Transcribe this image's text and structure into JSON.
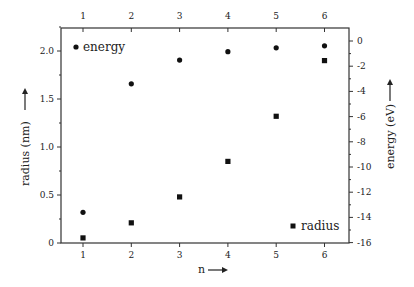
{
  "chart_data": {
    "type": "scatter",
    "title": "",
    "xlabel": "n",
    "ylabel_left": "radius (nm)",
    "ylabel_right": "energy (eV)",
    "x": [
      1,
      2,
      3,
      4,
      5,
      6
    ],
    "xlim": [
      0.55,
      6.85
    ],
    "ylim_left": [
      0,
      2.25
    ],
    "ylim_right": [
      -16,
      0
    ],
    "x_ticks": [
      "1",
      "2",
      "3",
      "4",
      "5",
      "6"
    ],
    "y_left_ticks": [
      "0",
      "0.5",
      "1.0",
      "1.5",
      "2.0"
    ],
    "y_right_ticks": [
      "0",
      "-2",
      "-4",
      "-6",
      "-8",
      "-10",
      "-12",
      "-14",
      "-16"
    ],
    "grid": false,
    "series": [
      {
        "name": "energy",
        "axis": "right",
        "marker": "circle",
        "values": [
          -13.6,
          -3.4,
          -1.51,
          -0.85,
          -0.54,
          -0.38
        ]
      },
      {
        "name": "radius",
        "axis": "left",
        "marker": "square",
        "values": [
          0.053,
          0.21,
          0.48,
          0.85,
          1.32,
          1.9
        ]
      }
    ],
    "legend": [
      {
        "label": "energy",
        "marker": "circle",
        "position": "top-left"
      },
      {
        "label": "radius",
        "marker": "square",
        "position": "bottom-right"
      }
    ]
  },
  "labels": {
    "x_axis": "n",
    "left_axis": "radius (nm)",
    "right_axis": "energy (eV)",
    "legend_energy": "energy",
    "legend_radius": "radius",
    "x_ticks": [
      "1",
      "2",
      "3",
      "4",
      "5",
      "6"
    ],
    "y_left_ticks": [
      "0",
      "0.5",
      "1.0",
      "1.5",
      "2.0"
    ],
    "y_right_ticks": [
      "0",
      "-2",
      "-4",
      "-6",
      "-8",
      "-10",
      "-12",
      "-14",
      "-16"
    ]
  }
}
